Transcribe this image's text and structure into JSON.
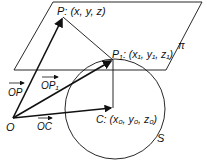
{
  "labels": {
    "P": "P: (x, y, z)",
    "P1_main": "P",
    "P1_sub": "1",
    "P1_coords": ": (x₁, y₁, z₁)",
    "C": "C: (x₀, y₀, z₀)",
    "O": "O",
    "pi": "π",
    "S": "S",
    "OP": "OP",
    "OP1": "OP₁",
    "OC": "OC"
  },
  "colors": {
    "line": "#111111",
    "background": "#ffffff"
  }
}
